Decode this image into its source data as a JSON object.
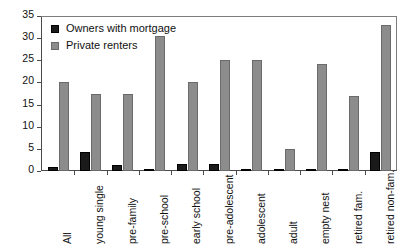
{
  "chart_data": {
    "type": "bar",
    "title": "",
    "subtitle": "",
    "xlabel": "",
    "ylabel": "",
    "ylim": [
      0,
      35
    ],
    "ytick_step": 5,
    "yticks": [
      0,
      5,
      10,
      15,
      20,
      25,
      30,
      35
    ],
    "grid": false,
    "legend_position": "top-left",
    "categories": [
      "All",
      "young single",
      "pre-family",
      "pre-school",
      "early school",
      "pre-adolescent",
      "adolescent",
      "adult",
      "empty nest",
      "retired fam.",
      "retired non-fam."
    ],
    "series": [
      {
        "name": "Owners with mortgage",
        "color": "#1a1a1a",
        "values": [
          1.0,
          4.3,
          1.3,
          0.2,
          1.5,
          1.6,
          0.2,
          0.2,
          0.2,
          0.2,
          4.2
        ]
      },
      {
        "name": "Private renters",
        "color": "#8c8c8c",
        "values": [
          20.0,
          17.3,
          17.3,
          30.5,
          20.0,
          25.0,
          25.0,
          5.0,
          24.2,
          17.0,
          33.0
        ]
      }
    ]
  },
  "legend": {
    "items": [
      {
        "label": "Owners with mortgage",
        "swatch": "owners"
      },
      {
        "label": "Private renters",
        "swatch": "renters"
      }
    ]
  },
  "axes": {
    "y_tick_labels": [
      "35",
      "30",
      "25",
      "20",
      "15",
      "10",
      "5",
      "0"
    ]
  }
}
